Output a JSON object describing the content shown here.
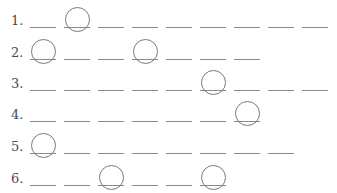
{
  "worksheet": {
    "rows": [
      {
        "label": "1.",
        "blanks": 9,
        "circled": [
          1
        ]
      },
      {
        "label": "2.",
        "blanks": 7,
        "circled": [
          0,
          3
        ]
      },
      {
        "label": "3.",
        "blanks": 9,
        "circled": [
          5
        ]
      },
      {
        "label": "4.",
        "blanks": 7,
        "circled": [
          6
        ]
      },
      {
        "label": "5.",
        "blanks": 8,
        "circled": [
          0
        ]
      },
      {
        "label": "6.",
        "blanks": 6,
        "circled": [
          2,
          5
        ]
      }
    ],
    "colors": {
      "text": "#4a4a4a",
      "line": "#8a8a8a",
      "circle": "#7a7a7a"
    }
  }
}
